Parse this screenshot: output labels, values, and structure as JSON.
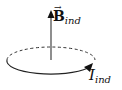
{
  "diagram": {
    "field_label": {
      "symbol": "B",
      "subscript": "ind",
      "vector_arrow": "⃗",
      "vec_glyph": "→"
    },
    "current_label": {
      "symbol": "I",
      "subscript": "ind"
    },
    "colors": {
      "stroke": "#222222",
      "background": "#ffffff"
    },
    "elements": [
      "field-arrow",
      "current-loop-dashed-back",
      "current-loop-solid-front",
      "current-direction-arrow"
    ]
  }
}
